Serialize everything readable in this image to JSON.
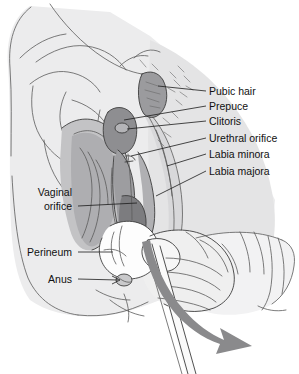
{
  "figure": {
    "type": "anatomical-line-illustration",
    "width": 299,
    "height": 374,
    "background_color": "#ffffff"
  },
  "colors": {
    "skin_fill": "#ececed",
    "skin_fill_2": "#e4e4e5",
    "labia_shade": "#b9b9bb",
    "labia_shade_dark": "#9d9da0",
    "inner_shade": "#8e8e91",
    "glove_fill": "#fbfbfb",
    "glove_shade": "#e8e8e9",
    "arrow_fill": "#8a8a8c",
    "outline": "#5b5b5b",
    "outline_dark": "#3d3d3d",
    "label_text": "#111111",
    "leader_line": "#1a1a1a"
  },
  "labels_right": [
    {
      "id": "pubic-hair",
      "text": "Pubic hair",
      "x": 209,
      "y": 95,
      "leader": {
        "x1": 206,
        "y1": 91,
        "x2": 158,
        "y2": 86
      }
    },
    {
      "id": "prepuce",
      "text": "Prepuce",
      "x": 209,
      "y": 110,
      "leader": {
        "x1": 206,
        "y1": 106,
        "x2": 124,
        "y2": 120
      }
    },
    {
      "id": "clitoris",
      "text": "Clitoris",
      "x": 209,
      "y": 125,
      "leader": {
        "x1": 206,
        "y1": 121,
        "x2": 127,
        "y2": 129
      }
    },
    {
      "id": "urethral-orifice",
      "text": "Urethral orifice",
      "x": 209,
      "y": 142,
      "leader": {
        "x1": 206,
        "y1": 138,
        "x2": 131,
        "y2": 156
      }
    },
    {
      "id": "labia-minora",
      "text": "Labia minora",
      "x": 209,
      "y": 158,
      "leader": {
        "x1": 206,
        "y1": 154,
        "x2": 167,
        "y2": 166
      }
    },
    {
      "id": "labia-majora",
      "text": "Labia majora",
      "x": 209,
      "y": 175,
      "leader": {
        "x1": 206,
        "y1": 171,
        "x2": 156,
        "y2": 196
      }
    }
  ],
  "labels_left": [
    {
      "id": "vaginal-orifice-line1",
      "text": "Vaginal",
      "x": 72,
      "y": 196
    },
    {
      "id": "vaginal-orifice-line2",
      "text": "orifice",
      "x": 72,
      "y": 210,
      "leader": {
        "x1": 78,
        "y1": 206,
        "x2": 137,
        "y2": 203
      }
    },
    {
      "id": "perineum",
      "text": "Perineum",
      "x": 72,
      "y": 256,
      "leader": {
        "x1": 78,
        "y1": 252,
        "x2": 113,
        "y2": 252
      }
    },
    {
      "id": "anus",
      "text": "Anus",
      "x": 72,
      "y": 283,
      "leader": {
        "x1": 78,
        "y1": 279,
        "x2": 120,
        "y2": 280
      }
    }
  ],
  "annotations": {
    "arrow": {
      "id": "direction-arrow",
      "description": "curved gray arrow indicating downward-outward swab withdrawal direction",
      "color": "#8a8a8c"
    },
    "swab": {
      "id": "swab-instrument",
      "description": "slender swab stick held in gloved hand"
    },
    "glove": {
      "id": "examination-glove",
      "description": "gloved hand with cuff at right"
    }
  }
}
